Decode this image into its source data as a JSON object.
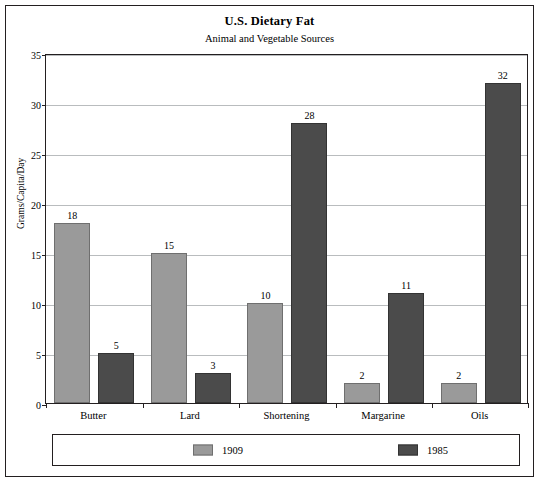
{
  "chart_data": {
    "type": "bar",
    "title": "U.S. Dietary Fat",
    "subtitle": "Animal and Vegetable Sources",
    "xlabel": "",
    "ylabel": "Grams/Capita/Day",
    "ylim": [
      0,
      35
    ],
    "yticks": [
      0,
      5,
      10,
      15,
      20,
      25,
      30,
      35
    ],
    "grid": true,
    "legend_position": "bottom",
    "categories": [
      "Butter",
      "Lard",
      "Shortening",
      "Margarine",
      "Oils"
    ],
    "series": [
      {
        "name": "1909",
        "color": "#9a9a9a",
        "values": [
          18,
          15,
          10,
          2,
          2
        ]
      },
      {
        "name": "1985",
        "color": "#4b4b4b",
        "values": [
          5,
          3,
          28,
          11,
          32
        ]
      }
    ]
  }
}
